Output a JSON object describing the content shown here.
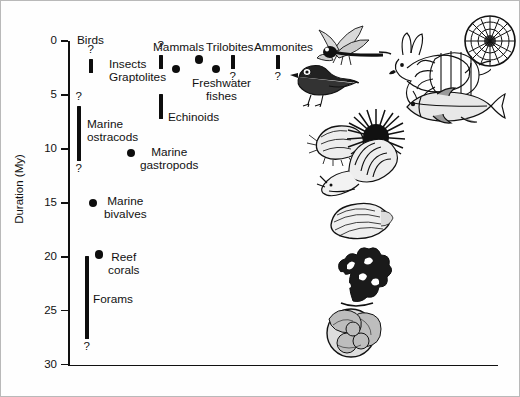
{
  "chart_data": {
    "type": "scatter",
    "title": "",
    "xlabel": "",
    "ylabel": "Duration (My)",
    "ylim": [
      0,
      30
    ],
    "y_inverted": true,
    "grid": false,
    "legend": "none",
    "y_ticks": [
      0,
      5,
      10,
      15,
      20,
      25,
      30
    ],
    "y_tick_labels": [
      "0",
      "5",
      "10",
      "15",
      "20",
      "25",
      "30"
    ],
    "points": [
      {
        "name": "Birds",
        "mark": "bar",
        "y_low": 1.7,
        "y_high": 3.0,
        "x_px": 90,
        "label": "Birds",
        "uncertain_above": true,
        "uncertain_below": false
      },
      {
        "name": "Insects",
        "mark": "bar",
        "y_low": 1.3,
        "y_high": 2.6,
        "x_px": 160,
        "label": "Insects",
        "uncertain_above": true,
        "uncertain_below": false
      },
      {
        "name": "Graptolites",
        "mark": "dot",
        "y": 2.6,
        "x_px": 175,
        "label": "Graptolites"
      },
      {
        "name": "Mammals",
        "mark": "dot",
        "y": 1.7,
        "x_px": 198,
        "label": "Mammals"
      },
      {
        "name": "Freshwater fishes",
        "mark": "dot",
        "y": 2.6,
        "x_px": 215,
        "label": "Freshwater\nfishes"
      },
      {
        "name": "Trilobites",
        "mark": "bar",
        "y_low": 1.3,
        "y_high": 2.6,
        "x_px": 232,
        "label": "Trilobites",
        "uncertain_below": true
      },
      {
        "name": "Ammonites",
        "mark": "bar",
        "y_low": 1.3,
        "y_high": 2.6,
        "x_px": 277,
        "label": "Ammonites",
        "uncertain_below": true
      },
      {
        "name": "Echinoids",
        "mark": "bar",
        "y_low": 4.9,
        "y_high": 7.2,
        "x_px": 160,
        "label": "Echinoids"
      },
      {
        "name": "Marine ostracods",
        "mark": "bar",
        "y_low": 6.0,
        "y_high": 11.1,
        "x_px": 78,
        "label": "Marine\nostracods",
        "uncertain_above": true,
        "uncertain_below": true
      },
      {
        "name": "Marine gastropods",
        "mark": "dot",
        "y": 10.4,
        "x_px": 130,
        "label": "Marine\ngastropods"
      },
      {
        "name": "Marine bivalves",
        "mark": "dot",
        "y": 15.0,
        "x_px": 92,
        "label": "Marine\nbivalves"
      },
      {
        "name": "Reef corals",
        "mark": "dot",
        "y": 19.8,
        "x_px": 98,
        "label": "Reef\ncorals"
      },
      {
        "name": "Forams",
        "mark": "bar",
        "y_low": 19.9,
        "y_high": 27.6,
        "x_px": 86,
        "label": "Forams",
        "uncertain_below": true
      }
    ]
  },
  "axis": {
    "y_title": "Duration (My)",
    "ticks": [
      "0",
      "5",
      "10",
      "15",
      "20",
      "25",
      "30"
    ]
  },
  "labels": {
    "birds": "Birds",
    "insects": "Insects",
    "graptolites": "Graptolites",
    "mammals": "Mammals",
    "freshwater_fishes_l1": "Freshwater",
    "freshwater_fishes_l2": "fishes",
    "trilobites": "Trilobites",
    "ammonites": "Ammonites",
    "echinoids": "Echinoids",
    "marine_ostracods_l1": "Marine",
    "marine_ostracods_l2": "ostracods",
    "marine_gastropods_l1": "Marine",
    "marine_gastropods_l2": "gastropods",
    "marine_bivalves_l1": "Marine",
    "marine_bivalves_l2": "bivalves",
    "reef_corals_l1": "Reef",
    "reef_corals_l2": "corals",
    "forams": "Forams",
    "question": "?"
  },
  "illustrations": [
    {
      "name": "bird-illustration",
      "alt": "songbird"
    },
    {
      "name": "dragonfly-illustration",
      "alt": "dragonfly insect"
    },
    {
      "name": "rabbit-illustration",
      "alt": "rabbit mammal"
    },
    {
      "name": "trilobite-illustration",
      "alt": "trilobite"
    },
    {
      "name": "ammonite-illustration",
      "alt": "ammonite shell"
    },
    {
      "name": "fish-illustration",
      "alt": "bony fish"
    },
    {
      "name": "ostracod-illustration",
      "alt": "ostracod"
    },
    {
      "name": "sea-urchin-illustration",
      "alt": "sea urchin echinoid"
    },
    {
      "name": "snail-illustration",
      "alt": "marine gastropod snail"
    },
    {
      "name": "clam-illustration",
      "alt": "bivalve clam"
    },
    {
      "name": "coral-illustration",
      "alt": "reef coral"
    },
    {
      "name": "foram-illustration",
      "alt": "foraminiferan"
    }
  ],
  "colors": {
    "ink": "#0d0d0d",
    "background": "#fefefe",
    "border": "#b9b9b9"
  }
}
